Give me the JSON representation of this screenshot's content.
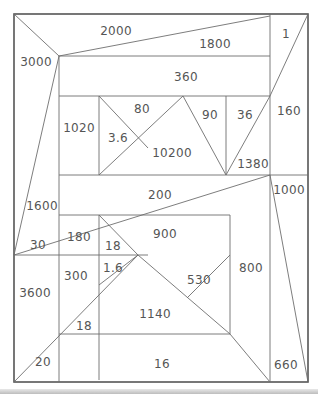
{
  "diagram": {
    "type": "area-dissection-puzzle",
    "frame": {
      "x": 14,
      "y": 14,
      "w": 294,
      "h": 368
    },
    "stroke_color": "#6e6e6e",
    "outer_stroke_color": "#555555",
    "label_color": "#555555",
    "lines": [
      [
        14,
        14,
        59,
        56
      ],
      [
        59,
        56,
        270,
        16
      ],
      [
        59,
        56,
        14,
        255
      ],
      [
        59,
        56,
        270,
        56
      ],
      [
        59,
        56,
        59,
        382
      ],
      [
        270,
        14,
        270,
        382
      ],
      [
        308,
        14,
        270,
        96
      ],
      [
        99,
        96,
        270,
        96
      ],
      [
        99,
        96,
        99,
        175
      ],
      [
        59,
        96,
        99,
        96
      ],
      [
        99,
        96,
        148,
        148
      ],
      [
        99,
        175,
        183,
        96
      ],
      [
        183,
        96,
        226,
        175
      ],
      [
        226,
        96,
        226,
        175
      ],
      [
        226,
        175,
        270,
        96
      ],
      [
        59,
        175,
        308,
        175
      ],
      [
        14,
        255,
        148,
        255
      ],
      [
        14,
        255,
        270,
        175
      ],
      [
        59,
        215,
        230,
        215
      ],
      [
        99,
        215,
        99,
        380
      ],
      [
        99,
        215,
        138,
        255
      ],
      [
        99,
        285,
        138,
        255
      ],
      [
        138,
        255,
        230,
        334
      ],
      [
        187,
        298,
        230,
        255
      ],
      [
        230,
        215,
        230,
        334
      ],
      [
        14,
        382,
        138,
        255
      ],
      [
        59,
        334,
        230,
        334
      ],
      [
        230,
        334,
        270,
        382
      ],
      [
        270,
        175,
        308,
        382
      ]
    ],
    "labels": [
      {
        "text": "2000",
        "x": 116,
        "y": 31
      },
      {
        "text": "1800",
        "x": 215,
        "y": 44
      },
      {
        "text": "1",
        "x": 286,
        "y": 34
      },
      {
        "text": "3000",
        "x": 36,
        "y": 62
      },
      {
        "text": "360",
        "x": 186,
        "y": 77
      },
      {
        "text": "80",
        "x": 142,
        "y": 109
      },
      {
        "text": "90",
        "x": 210,
        "y": 115
      },
      {
        "text": "36",
        "x": 245,
        "y": 115
      },
      {
        "text": "160",
        "x": 289,
        "y": 111
      },
      {
        "text": "1020",
        "x": 79,
        "y": 128
      },
      {
        "text": "3.6",
        "x": 118,
        "y": 138
      },
      {
        "text": "10200",
        "x": 172,
        "y": 153
      },
      {
        "text": "1380",
        "x": 253,
        "y": 164
      },
      {
        "text": "1000",
        "x": 289,
        "y": 190
      },
      {
        "text": "200",
        "x": 160,
        "y": 195
      },
      {
        "text": "1600",
        "x": 42,
        "y": 206
      },
      {
        "text": "180",
        "x": 79,
        "y": 237
      },
      {
        "text": "18",
        "x": 113,
        "y": 246
      },
      {
        "text": "900",
        "x": 165,
        "y": 234
      },
      {
        "text": "30",
        "x": 38,
        "y": 245
      },
      {
        "text": "1.6",
        "x": 113,
        "y": 268
      },
      {
        "text": "300",
        "x": 76,
        "y": 276
      },
      {
        "text": "530",
        "x": 199,
        "y": 280
      },
      {
        "text": "800",
        "x": 251,
        "y": 268
      },
      {
        "text": "3600",
        "x": 35,
        "y": 293
      },
      {
        "text": "1140",
        "x": 155,
        "y": 314
      },
      {
        "text": "18",
        "x": 84,
        "y": 326
      },
      {
        "text": "20",
        "x": 43,
        "y": 362
      },
      {
        "text": "16",
        "x": 162,
        "y": 364
      },
      {
        "text": "660",
        "x": 286,
        "y": 365
      }
    ]
  }
}
